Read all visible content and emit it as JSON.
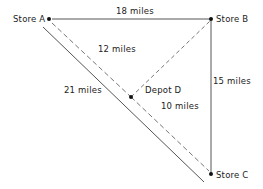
{
  "diagram": {
    "nodes": [
      {
        "id": "A",
        "label": "Store A",
        "x": 49,
        "y": 19
      },
      {
        "id": "B",
        "label": "Store B",
        "x": 211,
        "y": 19
      },
      {
        "id": "C",
        "label": "Store C",
        "x": 211,
        "y": 174
      },
      {
        "id": "D",
        "label": "Depot D",
        "x": 131,
        "y": 97
      }
    ],
    "edges": [
      {
        "from": "A",
        "to": "B",
        "label": "18 miles",
        "style": "solid"
      },
      {
        "from": "B",
        "to": "C",
        "label": "15 miles",
        "style": "solid"
      },
      {
        "from": "A",
        "to": "C",
        "label": "21 miles",
        "style": "solid"
      },
      {
        "from": "A",
        "to": "D",
        "label": "12 miles",
        "style": "dashed"
      },
      {
        "from": "D",
        "to": "B",
        "label": "",
        "style": "dashed"
      },
      {
        "from": "D",
        "to": "C",
        "label": "10 miles",
        "style": "dashed"
      }
    ],
    "colors": {
      "line": "#555555",
      "dot": "#111111",
      "text": "#222222",
      "background": "#ffffff"
    }
  }
}
